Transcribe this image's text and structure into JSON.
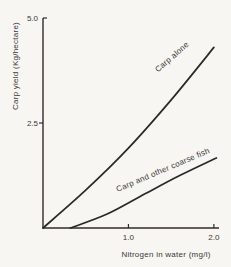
{
  "figure": {
    "background_color": "#f8f6f3",
    "axis_color": "#2f2d2b",
    "text_color": "#3a3733",
    "line_color": "#2b2926"
  },
  "chart_data": {
    "type": "line",
    "title": "",
    "xlabel": "Nitrogen in water (mg/l)",
    "ylabel": "Carp yield (Kg/hectare)",
    "xlim": [
      0,
      2.06
    ],
    "ylim": [
      0,
      5.0
    ],
    "grid": false,
    "legend_position": "inline-curve-labels",
    "x_ticks": [
      {
        "value": 1.0,
        "label": "1.0"
      },
      {
        "value": 2.0,
        "label": "2.0"
      }
    ],
    "y_ticks": [
      {
        "value": 2.5,
        "label": "2.5"
      },
      {
        "value": 5.0,
        "label": "5.0"
      }
    ],
    "series": [
      {
        "name": "Carp alone",
        "x": [
          0,
          0.5,
          1.0,
          1.5,
          2.0
        ],
        "y": [
          0,
          0.9,
          1.9,
          3.05,
          4.3
        ],
        "label_anchor": {
          "x": 1.51,
          "y": 4.07
        },
        "label_rotation_deg": -41
      },
      {
        "name": "Carp and other coarse fish",
        "x": [
          0.32,
          0.75,
          1.2,
          1.6,
          2.03
        ],
        "y": [
          0,
          0.33,
          0.82,
          1.25,
          1.67
        ],
        "label_anchor": {
          "x": 1.4,
          "y": 1.38
        },
        "label_rotation_deg": -23
      }
    ]
  }
}
